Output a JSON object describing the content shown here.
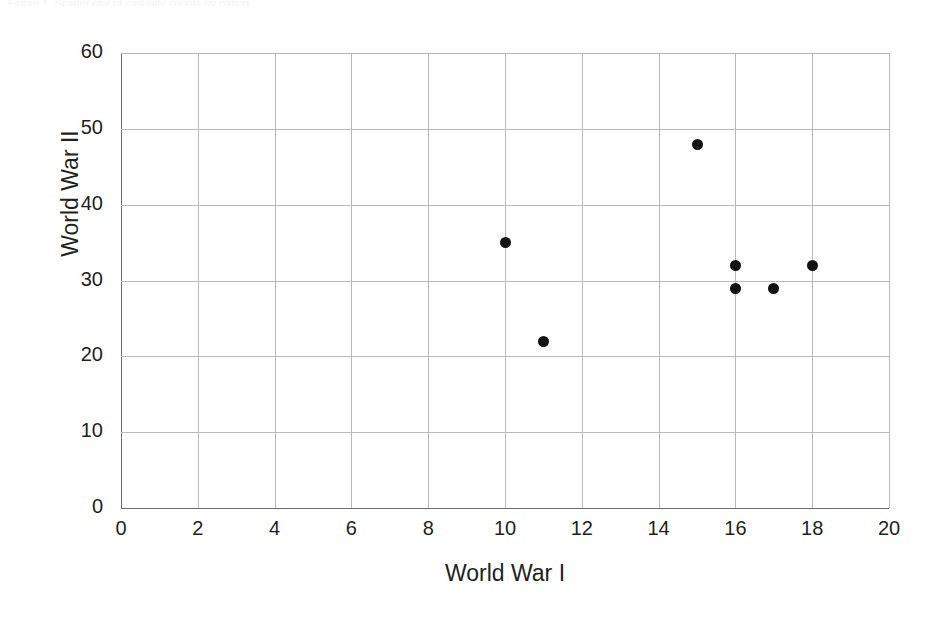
{
  "figure": {
    "top_strip_text": "Figure 1. Scatter plot of casualty counts by nation",
    "background_color": "#ffffff",
    "point_color": "#131313",
    "gridline_color": "#b9b9bb",
    "axis_color": "#6e6e72",
    "text_color": "#231f20"
  },
  "chart_data": {
    "type": "scatter",
    "title": "",
    "xlabel": "World War I",
    "ylabel": "World War II",
    "xlim": [
      0,
      20
    ],
    "ylim": [
      0,
      60
    ],
    "xticks": [
      0,
      2,
      4,
      6,
      8,
      10,
      12,
      14,
      16,
      18,
      20
    ],
    "xtick_labels": [
      "0",
      "2",
      "4",
      "6",
      "8",
      "10",
      "12",
      "14",
      "16",
      "18",
      "20"
    ],
    "yticks": [
      0,
      10,
      20,
      30,
      40,
      50,
      60
    ],
    "ytick_labels": [
      "0",
      "10",
      "20",
      "30",
      "40",
      "50",
      "60"
    ],
    "grid": true,
    "grid_axes": "both",
    "legend": false,
    "legend_position": "none",
    "marker": "circle",
    "marker_size": 11,
    "points": [
      {
        "x": 10,
        "y": 35
      },
      {
        "x": 11,
        "y": 22
      },
      {
        "x": 15,
        "y": 48
      },
      {
        "x": 16,
        "y": 32
      },
      {
        "x": 16,
        "y": 29
      },
      {
        "x": 17,
        "y": 29
      },
      {
        "x": 18,
        "y": 32
      }
    ]
  }
}
